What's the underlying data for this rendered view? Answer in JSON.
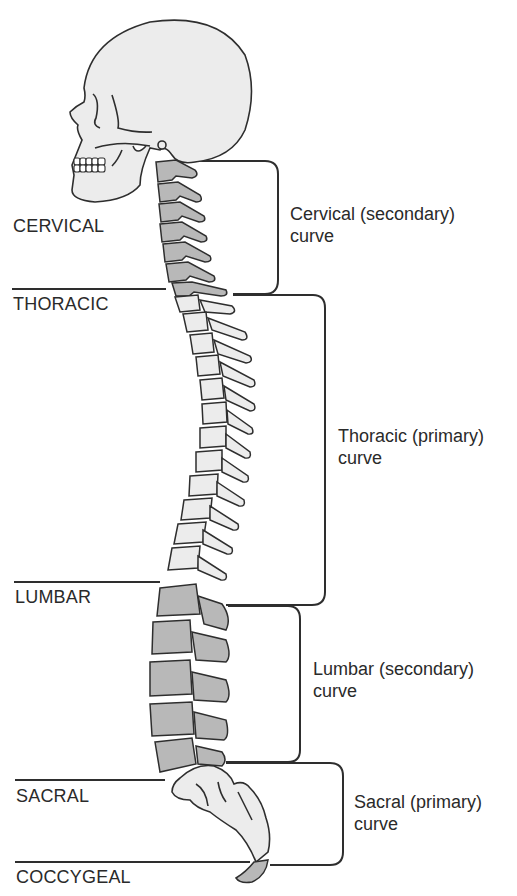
{
  "diagram": {
    "colors": {
      "bone_light": "#ececec",
      "bone_dark": "#b8b8b8",
      "outline": "#2e2e2e",
      "text": "#2a2a2a"
    },
    "regions": [
      {
        "label": "CERVICAL"
      },
      {
        "label": "THORACIC"
      },
      {
        "label": "LUMBAR"
      },
      {
        "label": "SACRAL"
      },
      {
        "label": "COCCYGEAL"
      }
    ],
    "curves": [
      {
        "line1": "Cervical (secondary)",
        "line2": "curve"
      },
      {
        "line1": "Thoracic (primary)",
        "line2": "curve"
      },
      {
        "line1": "Lumbar (secondary)",
        "line2": "curve"
      },
      {
        "line1": "Sacral (primary)",
        "line2": "curve"
      }
    ]
  }
}
